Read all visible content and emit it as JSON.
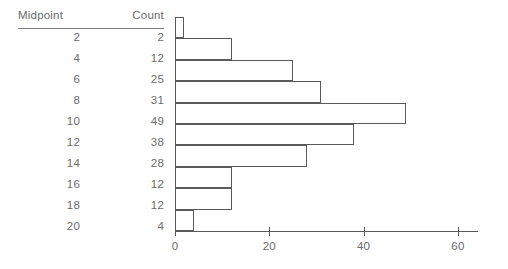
{
  "table": {
    "header": {
      "midpoint": "Midpoint",
      "count": "Count"
    },
    "rows": [
      {
        "midpoint": "2",
        "count": "2"
      },
      {
        "midpoint": "4",
        "count": "12"
      },
      {
        "midpoint": "6",
        "count": "25"
      },
      {
        "midpoint": "8",
        "count": "31"
      },
      {
        "midpoint": "10",
        "count": "49"
      },
      {
        "midpoint": "12",
        "count": "38"
      },
      {
        "midpoint": "14",
        "count": "28"
      },
      {
        "midpoint": "16",
        "count": "12"
      },
      {
        "midpoint": "18",
        "count": "12"
      },
      {
        "midpoint": "20",
        "count": "4"
      }
    ]
  },
  "axis": {
    "ticks": [
      {
        "label": "0",
        "value": 0
      },
      {
        "label": "20",
        "value": 20
      },
      {
        "label": "40",
        "value": 40
      },
      {
        "label": "60",
        "value": 60
      }
    ]
  },
  "colors": {
    "line": "#5a5a5a",
    "rule": "#7d7d7d",
    "text": "#6b6b6b",
    "background": "#ffffff"
  },
  "chart_data": {
    "type": "bar",
    "orientation": "horizontal",
    "title": "",
    "xlabel": "",
    "ylabel": "",
    "categories": [
      "2",
      "4",
      "6",
      "8",
      "10",
      "12",
      "14",
      "16",
      "18",
      "20"
    ],
    "values": [
      2,
      12,
      25,
      31,
      49,
      38,
      28,
      12,
      12,
      4
    ],
    "series": [
      {
        "name": "Count",
        "values": [
          2,
          12,
          25,
          31,
          49,
          38,
          28,
          12,
          12,
          4
        ]
      }
    ],
    "xlim": [
      0,
      64
    ],
    "ylim": [
      0,
      10
    ],
    "xticks": [
      0,
      20,
      40,
      60
    ],
    "grid": false,
    "legend": false
  }
}
